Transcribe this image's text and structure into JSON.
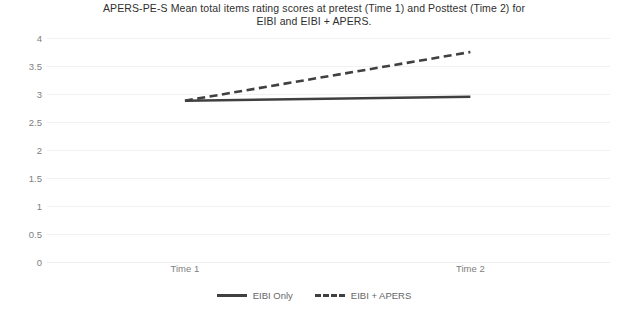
{
  "chart_data": {
    "type": "line",
    "title": "APERS-PE-S Mean total items rating scores at pretest (Time 1) and Posttest (Time 2) for EIBI and EIBI + APERS.",
    "title_line1": "APERS-PE-S Mean total items rating scores at pretest (Time 1) and Posttest (Time 2) for",
    "title_line2": "EIBI and EIBI + APERS.",
    "xlabel": "",
    "ylabel": "",
    "categories": [
      "Time 1",
      "Time 2"
    ],
    "ylim": [
      0,
      4
    ],
    "yticks": [
      0,
      0.5,
      1,
      1.5,
      2,
      2.5,
      3,
      3.5,
      4
    ],
    "ytick_labels": [
      "0",
      "0.5",
      "1",
      "1.5",
      "2",
      "2.5",
      "3",
      "3.5",
      "4"
    ],
    "grid": true,
    "legend_position": "bottom",
    "series": [
      {
        "name": "EIBI Only",
        "style": "solid",
        "color": "#404040",
        "values": [
          2.88,
          2.95
        ]
      },
      {
        "name": "EIBI + APERS",
        "style": "dashed",
        "color": "#404040",
        "values": [
          2.88,
          3.75
        ]
      }
    ]
  },
  "legend": {
    "items": [
      {
        "label": "EIBI Only",
        "style": "solid"
      },
      {
        "label": "EIBI + APERS",
        "style": "dashed"
      }
    ]
  }
}
